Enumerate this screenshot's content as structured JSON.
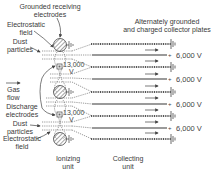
{
  "labels": {
    "grounded_receiving": [
      "Grounded receiving",
      "electrodes"
    ],
    "electrostatic_field_top": [
      "Electrostatic",
      "field"
    ],
    "dust_particles_top": [
      "Dust",
      "particles"
    ],
    "gas_flow": [
      "Gas",
      "flow"
    ],
    "discharge_electrodes": [
      "Discharge",
      "electrodes"
    ],
    "dust_particles_bottom": [
      "Dust",
      "particles"
    ],
    "electrostatic_field_bottom": [
      "Electrostatic",
      "field"
    ],
    "collector_plates": [
      "Alternately grounded",
      "and charged collector plates"
    ],
    "ionizing_unit": [
      "Ionizing",
      "unit"
    ],
    "collecting_unit": [
      "Collecting",
      "unit"
    ]
  },
  "voltages": {
    "discharge": [
      "13,000",
      "V"
    ],
    "plate_voltage": "6,000 V",
    "charged_plate_voltages": [
      "6,000 V",
      "6,000 V",
      "6,000 V",
      "6,000 V"
    ]
  },
  "colors": {
    "line": "#555555",
    "plate_charged": "#9a9a9a",
    "hatch": "#777777"
  }
}
